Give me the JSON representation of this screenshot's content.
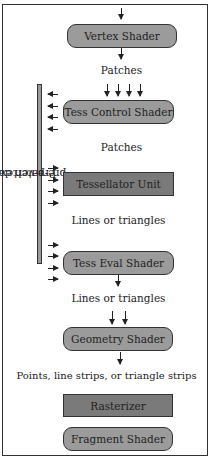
{
  "diagram": {
    "nodes": [
      {
        "id": "vertex",
        "label": "Vertex Shader",
        "shape": "rounded",
        "color": "#9b9b9b"
      },
      {
        "id": "tess_control",
        "label": "Tess Control Shader",
        "shape": "rounded",
        "color": "#9b9b9b"
      },
      {
        "id": "tessellator",
        "label": "Tessellator Unit",
        "shape": "rect",
        "color": "#7a7a7a"
      },
      {
        "id": "tess_eval",
        "label": "Tess Eval Shader",
        "shape": "rounded",
        "color": "#9b9b9b"
      },
      {
        "id": "geometry",
        "label": "Geometry Shader",
        "shape": "rounded",
        "color": "#9b9b9b"
      },
      {
        "id": "rasterizer",
        "label": "Rasterizer",
        "shape": "rect",
        "color": "#7a7a7a"
      },
      {
        "id": "fragment",
        "label": "Fragment Shader",
        "shape": "rounded",
        "color": "#9b9b9b"
      }
    ],
    "edge_labels": {
      "after_vertex": "Patches",
      "after_tess_control": "Patches",
      "after_tessellator": "Lines or triangles",
      "after_tess_eval": "Lines or triangles",
      "after_geometry": "Points, line strips, or triangle strips"
    },
    "side_bar": {
      "line1": "Pre-vertex data",
      "line2": "pre-patch data"
    }
  }
}
